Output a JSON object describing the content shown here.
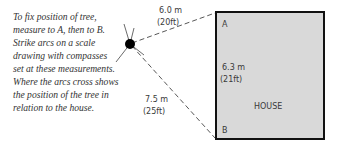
{
  "caption": {
    "lines": [
      "To fix position of tree,",
      "measure to A, then to B.",
      "Strike arcs on a scale",
      "drawing with compasses",
      "set at these measurements.",
      "Where the arcs cross shows",
      "the position of the tree in",
      "relation to the house."
    ]
  },
  "diagram": {
    "house_label": "HOUSE",
    "corner_a": "A",
    "corner_b": "B",
    "measure_to_a": {
      "metric": "6.0 m",
      "imperial": "(20ft)"
    },
    "measure_to_b": {
      "metric": "7.5 m",
      "imperial": "(25ft)"
    },
    "house_side": {
      "metric": "6.3 m",
      "imperial": "(21ft)"
    },
    "colors": {
      "house_fill": "#d9d9d9",
      "outline": "#111111",
      "ink": "#3a3a3a"
    }
  }
}
